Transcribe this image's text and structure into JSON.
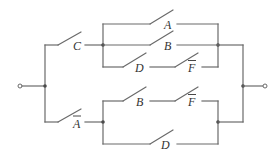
{
  "diagram": {
    "type": "switching-circuit",
    "colors": {
      "wire": "#6a6a6a",
      "node": "#4a4a4a",
      "label": "#333333",
      "background": "#ffffff"
    },
    "terminals": {
      "input": "input-terminal",
      "output": "output-terminal"
    },
    "switches": {
      "c": {
        "label": "C",
        "complemented": false
      },
      "a": {
        "label": "A",
        "complemented": false
      },
      "b_top": {
        "label": "B",
        "complemented": false
      },
      "d_top": {
        "label": "D",
        "complemented": false
      },
      "f_top": {
        "label": "F",
        "complemented": true
      },
      "a_bar": {
        "label": "A",
        "complemented": true
      },
      "b_bottom": {
        "label": "B",
        "complemented": false
      },
      "f_bottom": {
        "label": "F",
        "complemented": true
      },
      "d_bottom": {
        "label": "D",
        "complemented": false
      }
    },
    "structure": {
      "top_branch": "C in series with (A || B || (D series F̄))",
      "bottom_branch": "Ā in series with ((B series F̄) || D)",
      "overall": "top_branch || bottom_branch"
    }
  }
}
